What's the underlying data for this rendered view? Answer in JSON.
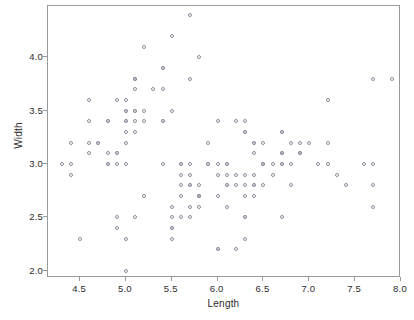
{
  "chart_data": {
    "type": "scatter",
    "title": "",
    "xlabel": "Length",
    "ylabel": "Width",
    "xlim": [
      4.15,
      8.0
    ],
    "ylim": [
      1.93,
      4.48
    ],
    "xticks": [
      "4.5",
      "5.0",
      "5.5",
      "6.0",
      "6.5",
      "7.0",
      "7.5",
      "8.0"
    ],
    "xtick_values": [
      4.5,
      5.0,
      5.5,
      6.0,
      6.5,
      7.0,
      7.5,
      8.0
    ],
    "yticks": [
      "2.0",
      "2.5",
      "3.0",
      "3.5",
      "4.0"
    ],
    "ytick_values": [
      2.0,
      2.5,
      3.0,
      3.5,
      4.0
    ],
    "grid": false,
    "legend": null,
    "marker": "open-circle",
    "marker_color": "#8e8e9c",
    "frame_color": "#9a9a9a",
    "points": [
      [
        5.1,
        3.5
      ],
      [
        4.9,
        3.0
      ],
      [
        4.7,
        3.2
      ],
      [
        4.6,
        3.1
      ],
      [
        5.0,
        3.6
      ],
      [
        5.4,
        3.9
      ],
      [
        4.6,
        3.4
      ],
      [
        5.0,
        3.4
      ],
      [
        4.4,
        2.9
      ],
      [
        4.9,
        3.1
      ],
      [
        5.4,
        3.7
      ],
      [
        4.8,
        3.4
      ],
      [
        4.8,
        3.0
      ],
      [
        4.3,
        3.0
      ],
      [
        5.8,
        4.0
      ],
      [
        5.7,
        4.4
      ],
      [
        5.4,
        3.9
      ],
      [
        5.1,
        3.5
      ],
      [
        5.7,
        3.8
      ],
      [
        5.1,
        3.8
      ],
      [
        5.4,
        3.4
      ],
      [
        5.1,
        3.7
      ],
      [
        4.6,
        3.6
      ],
      [
        5.1,
        3.3
      ],
      [
        4.8,
        3.4
      ],
      [
        5.0,
        3.0
      ],
      [
        5.0,
        3.4
      ],
      [
        5.2,
        3.5
      ],
      [
        5.2,
        3.4
      ],
      [
        4.7,
        3.2
      ],
      [
        4.8,
        3.1
      ],
      [
        5.4,
        3.4
      ],
      [
        5.2,
        4.1
      ],
      [
        5.5,
        4.2
      ],
      [
        4.9,
        3.1
      ],
      [
        5.0,
        3.2
      ],
      [
        5.5,
        3.5
      ],
      [
        4.9,
        3.6
      ],
      [
        4.4,
        3.0
      ],
      [
        5.1,
        3.4
      ],
      [
        5.0,
        3.5
      ],
      [
        4.5,
        2.3
      ],
      [
        4.4,
        3.2
      ],
      [
        5.0,
        3.5
      ],
      [
        5.1,
        3.8
      ],
      [
        4.8,
        3.0
      ],
      [
        5.1,
        3.8
      ],
      [
        4.6,
        3.2
      ],
      [
        5.3,
        3.7
      ],
      [
        5.0,
        3.3
      ],
      [
        7.0,
        3.2
      ],
      [
        6.4,
        3.2
      ],
      [
        6.9,
        3.1
      ],
      [
        5.5,
        2.3
      ],
      [
        6.5,
        2.8
      ],
      [
        5.7,
        2.8
      ],
      [
        6.3,
        3.3
      ],
      [
        4.9,
        2.4
      ],
      [
        6.6,
        2.9
      ],
      [
        5.2,
        2.7
      ],
      [
        5.0,
        2.0
      ],
      [
        5.9,
        3.0
      ],
      [
        6.0,
        2.2
      ],
      [
        6.1,
        2.9
      ],
      [
        5.6,
        2.9
      ],
      [
        6.7,
        3.1
      ],
      [
        5.6,
        3.0
      ],
      [
        5.8,
        2.7
      ],
      [
        6.2,
        2.2
      ],
      [
        5.6,
        2.5
      ],
      [
        5.9,
        3.2
      ],
      [
        6.1,
        2.8
      ],
      [
        6.3,
        2.5
      ],
      [
        6.1,
        2.8
      ],
      [
        6.4,
        2.9
      ],
      [
        6.6,
        3.0
      ],
      [
        6.8,
        2.8
      ],
      [
        6.7,
        3.0
      ],
      [
        6.0,
        2.9
      ],
      [
        5.7,
        2.6
      ],
      [
        5.5,
        2.4
      ],
      [
        5.5,
        2.4
      ],
      [
        5.8,
        2.7
      ],
      [
        6.0,
        2.7
      ],
      [
        5.4,
        3.0
      ],
      [
        6.0,
        3.4
      ],
      [
        6.7,
        3.1
      ],
      [
        6.3,
        2.3
      ],
      [
        5.6,
        3.0
      ],
      [
        5.5,
        2.5
      ],
      [
        5.5,
        2.6
      ],
      [
        6.1,
        3.0
      ],
      [
        5.8,
        2.6
      ],
      [
        5.0,
        2.3
      ],
      [
        5.6,
        2.7
      ],
      [
        5.7,
        3.0
      ],
      [
        5.7,
        2.9
      ],
      [
        6.2,
        2.9
      ],
      [
        5.1,
        2.5
      ],
      [
        5.7,
        2.8
      ],
      [
        6.3,
        3.3
      ],
      [
        5.8,
        2.7
      ],
      [
        7.1,
        3.0
      ],
      [
        6.3,
        2.9
      ],
      [
        6.5,
        3.0
      ],
      [
        7.6,
        3.0
      ],
      [
        4.9,
        2.5
      ],
      [
        7.3,
        2.9
      ],
      [
        6.7,
        2.5
      ],
      [
        7.2,
        3.6
      ],
      [
        6.5,
        3.2
      ],
      [
        6.4,
        2.7
      ],
      [
        6.8,
        3.0
      ],
      [
        5.7,
        2.5
      ],
      [
        5.8,
        2.8
      ],
      [
        6.4,
        3.2
      ],
      [
        6.5,
        3.0
      ],
      [
        7.7,
        3.8
      ],
      [
        7.7,
        2.6
      ],
      [
        6.0,
        2.2
      ],
      [
        6.9,
        3.2
      ],
      [
        5.6,
        2.8
      ],
      [
        7.7,
        2.8
      ],
      [
        6.3,
        2.7
      ],
      [
        6.7,
        3.3
      ],
      [
        7.2,
        3.2
      ],
      [
        6.2,
        2.8
      ],
      [
        6.1,
        3.0
      ],
      [
        6.4,
        2.8
      ],
      [
        7.2,
        3.0
      ],
      [
        7.4,
        2.8
      ],
      [
        7.9,
        3.8
      ],
      [
        6.4,
        2.8
      ],
      [
        6.3,
        2.8
      ],
      [
        6.1,
        2.6
      ],
      [
        7.7,
        3.0
      ],
      [
        6.3,
        3.4
      ],
      [
        6.4,
        3.1
      ],
      [
        6.0,
        3.0
      ],
      [
        6.9,
        3.1
      ],
      [
        6.7,
        3.1
      ],
      [
        6.9,
        3.1
      ],
      [
        5.8,
        2.7
      ],
      [
        6.8,
        3.2
      ],
      [
        6.7,
        3.3
      ],
      [
        6.7,
        3.0
      ],
      [
        6.3,
        2.5
      ],
      [
        6.5,
        3.0
      ],
      [
        6.2,
        3.4
      ],
      [
        5.9,
        3.0
      ]
    ]
  }
}
